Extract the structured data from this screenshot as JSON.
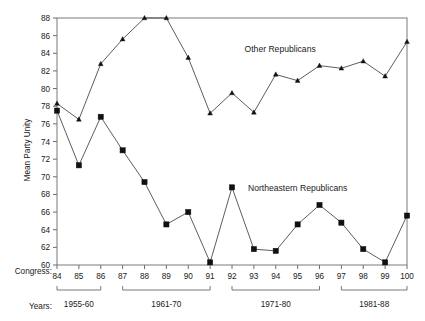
{
  "chart_data": {
    "type": "line",
    "title": "",
    "subtitle": "",
    "xlabel": "",
    "ylabel": "Mean Party Unity",
    "ylim": [
      60,
      88
    ],
    "y_ticks": [
      60,
      62,
      64,
      66,
      68,
      70,
      72,
      74,
      76,
      78,
      80,
      82,
      84,
      86,
      88
    ],
    "grid": false,
    "legend_position": "inline-annotations",
    "x_row_label": "Congress:",
    "group_row_label": "Years:",
    "categories": [
      84,
      85,
      86,
      87,
      88,
      89,
      90,
      91,
      92,
      93,
      94,
      95,
      96,
      97,
      98,
      99,
      100
    ],
    "x_tick_labels": [
      "84",
      "85",
      "86",
      "87",
      "88",
      "89",
      "90",
      "91",
      "92",
      "93",
      "94",
      "95",
      "96",
      "97",
      "98",
      "99",
      "100"
    ],
    "series": [
      {
        "name": "Other Republicans",
        "marker": "triangle",
        "values": [
          78.3,
          76.5,
          82.8,
          85.6,
          88.0,
          88.0,
          83.5,
          77.2,
          79.5,
          77.3,
          81.6,
          80.9,
          82.6,
          82.3,
          83.1,
          81.4,
          85.3
        ]
      },
      {
        "name": "Northeastern Republicans",
        "marker": "square",
        "values": [
          77.5,
          71.3,
          76.8,
          73.0,
          69.4,
          64.6,
          66.0,
          60.3,
          68.8,
          61.8,
          61.6,
          64.6,
          66.8,
          64.8,
          61.8,
          60.3,
          65.6
        ]
      }
    ],
    "annotations": [
      {
        "text": "Other Republicans",
        "x": 94.2,
        "y": 84.2
      },
      {
        "text": "Northeastern Republicans",
        "x": 95.0,
        "y": 68.4
      }
    ],
    "groups": [
      {
        "label": "1955-60",
        "start": 84,
        "end": 86
      },
      {
        "label": "1961-70",
        "start": 87,
        "end": 91
      },
      {
        "label": "1971-80",
        "start": 92,
        "end": 96
      },
      {
        "label": "1981-88",
        "start": 97,
        "end": 100
      }
    ],
    "colors": {
      "line": "#333333",
      "marker": "#111111",
      "frame": "#7a7a7a",
      "text": "#1a1a1a",
      "background": "#ffffff"
    }
  }
}
